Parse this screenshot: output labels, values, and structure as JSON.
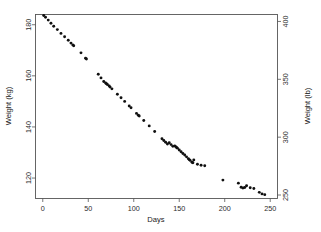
{
  "chart_data": {
    "type": "scatter",
    "title": "",
    "xlabel": "Days",
    "ylabel": "Weight (kg)",
    "ylabel_right": "Weight (lb)",
    "xlim": [
      -8,
      258
    ],
    "ylim": [
      112,
      184
    ],
    "ylim_right": [
      247,
      406
    ],
    "grid": false,
    "legend": null,
    "xticks": [
      0,
      50,
      100,
      150,
      200,
      250
    ],
    "xticklabels": [
      "0",
      "50",
      "100",
      "150",
      "200",
      "250"
    ],
    "yticks": [
      120,
      140,
      160,
      180
    ],
    "yticklabels": [
      "120",
      "140",
      "160",
      "180"
    ],
    "yticks_right": [
      250,
      300,
      350,
      400
    ],
    "yticklabels_right": [
      "250",
      "300",
      "350",
      "400"
    ],
    "marker": "filled-circle",
    "marker_color": "#101010",
    "series_name": "weight",
    "x": [
      1,
      3,
      6,
      9,
      12,
      16,
      20,
      24,
      28,
      31,
      33,
      34,
      42,
      47,
      48,
      61,
      64,
      67,
      69,
      70,
      71,
      73,
      74,
      76,
      82,
      86,
      90,
      95,
      97,
      103,
      105,
      106,
      111,
      117,
      123,
      131,
      133,
      135,
      137,
      139,
      141,
      143,
      145,
      146,
      147,
      148,
      150,
      152,
      154,
      156,
      158,
      160,
      161,
      162,
      164,
      165,
      166,
      170,
      174,
      178,
      198,
      215,
      218,
      220,
      222,
      224,
      228,
      232,
      238,
      241,
      244
    ],
    "y": [
      183.6,
      182.9,
      181.8,
      180.6,
      179.4,
      178.1,
      176.6,
      175.3,
      173.9,
      172.8,
      172.1,
      171.8,
      169.0,
      166.9,
      166.6,
      160.6,
      159.2,
      157.8,
      157.2,
      156.9,
      156.6,
      156.0,
      155.6,
      154.9,
      152.8,
      151.4,
      150.0,
      148.2,
      147.5,
      145.3,
      144.6,
      144.3,
      142.5,
      140.4,
      138.2,
      135.4,
      134.7,
      134.0,
      133.3,
      133.8,
      133.1,
      132.4,
      132.6,
      132.3,
      132.0,
      131.7,
      131.0,
      130.3,
      129.6,
      129.0,
      128.3,
      127.6,
      127.2,
      126.9,
      126.2,
      126.0,
      127.1,
      125.4,
      125.0,
      124.8,
      119.2,
      118.0,
      116.4,
      116.1,
      116.3,
      117.0,
      116.2,
      115.9,
      114.4,
      113.8,
      113.5
    ]
  }
}
